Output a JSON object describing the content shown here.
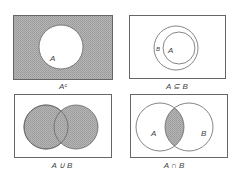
{
  "figure": {
    "panels": [
      {
        "id": "complement",
        "caption": "Aᶜ",
        "description": "Complement of A: universe shaded, A unshaded",
        "circle_labels": [
          "A"
        ]
      },
      {
        "id": "subset",
        "caption": "A ⊆ B",
        "description": "A is a subset of B: circle A inside circle B",
        "circle_labels": [
          "A",
          "B"
        ]
      },
      {
        "id": "union",
        "caption": "A ∪ B",
        "description": "Union of A and B: both circles shaded",
        "circle_labels": []
      },
      {
        "id": "intersection",
        "caption": "A ∩ B",
        "description": "Intersection of A and B: overlap shaded",
        "circle_labels": [
          "A",
          "B"
        ]
      }
    ],
    "colors": {
      "shade": "#a9a9a9",
      "stroke": "#666666",
      "background": "#ffffff",
      "text": "#444444"
    }
  }
}
